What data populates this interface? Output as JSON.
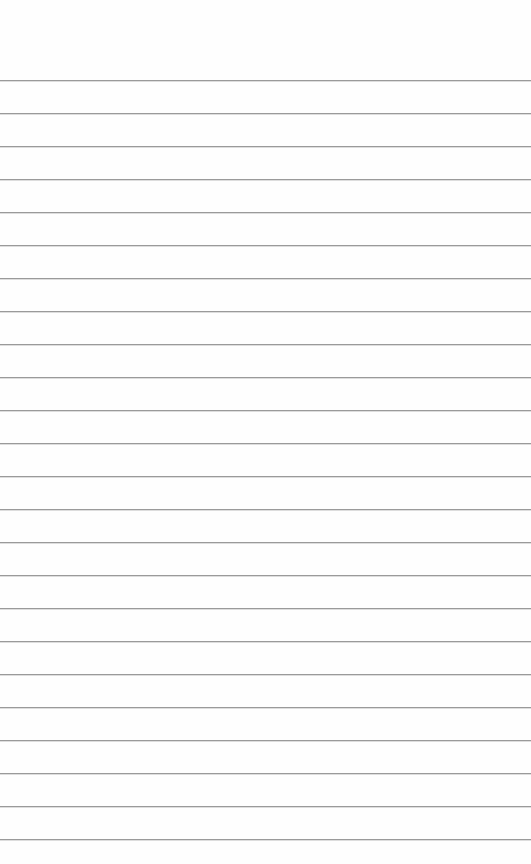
{
  "page": {
    "type": "lined-paper",
    "background_color": "#fefefe",
    "rule_color": "#9a9a9a",
    "first_rule_y": 80,
    "rule_spacing": 33,
    "rule_count": 24
  }
}
